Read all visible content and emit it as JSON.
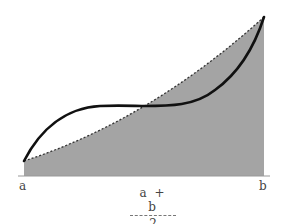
{
  "diagram": {
    "type": "integral-approximation",
    "labels": {
      "left": "a",
      "right": "b",
      "midpoint_numerator": "a + b",
      "midpoint_denominator": "2"
    },
    "colors": {
      "shaded_region": "#a4a4a4",
      "curve": "#111111",
      "dashed_chord": "#333333",
      "axis": "#999999"
    }
  }
}
